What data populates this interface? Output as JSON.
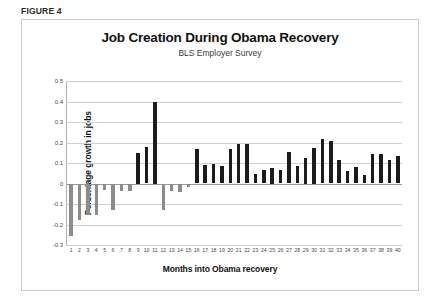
{
  "figure": {
    "label": "FIGURE 4"
  },
  "chart_data": {
    "type": "bar",
    "title": "Job Creation During Obama Recovery",
    "subtitle": "BLS Employer Survey",
    "xlabel": "Months into Obama recovery",
    "ylabel": "Percentage growth in jobs",
    "ylim": [
      -0.3,
      0.5
    ],
    "ytick_labels": [
      "0.5",
      "0.4",
      "0.3",
      "0.2",
      "0.1",
      "0",
      "-0.1",
      "-0.2",
      "-0.3"
    ],
    "ytick_values": [
      0.5,
      0.4,
      0.3,
      0.2,
      0.1,
      0,
      -0.1,
      -0.2,
      -0.3
    ],
    "grid": true,
    "legend": "none",
    "categories": [
      "1",
      "2",
      "3",
      "4",
      "5",
      "6",
      "7",
      "8",
      "9",
      "10",
      "11",
      "12",
      "13",
      "14",
      "15",
      "16",
      "17",
      "18",
      "19",
      "20",
      "21",
      "22",
      "23",
      "24",
      "25",
      "26",
      "27",
      "28",
      "29",
      "30",
      "31",
      "32",
      "33",
      "34",
      "35",
      "36",
      "37",
      "38",
      "39",
      "40"
    ],
    "values": [
      -0.255,
      -0.18,
      -0.155,
      -0.155,
      -0.03,
      -0.13,
      -0.035,
      -0.035,
      0.15,
      0.18,
      0.4,
      -0.13,
      -0.035,
      -0.04,
      -0.015,
      0.17,
      0.09,
      0.095,
      0.085,
      0.17,
      0.195,
      0.195,
      0.045,
      0.065,
      0.075,
      0.065,
      0.155,
      0.085,
      0.125,
      0.175,
      0.215,
      0.205,
      0.115,
      0.06,
      0.08,
      0.04,
      0.145,
      0.145,
      0.115,
      0.135
    ],
    "positive_color": "#1b1b1b",
    "negative_color": "#8c8c8c"
  }
}
